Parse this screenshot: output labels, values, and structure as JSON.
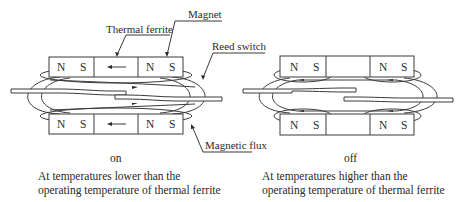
{
  "labels": {
    "magnet": "Magnet",
    "thermal_ferrite": "Thermal ferrite",
    "reed_switch": "Reed switch",
    "magnetic_flux": "Magnetic flux"
  },
  "poles": {
    "north": "N",
    "south": "S"
  },
  "ferrite_arrow": "←",
  "left_panel": {
    "state": "on",
    "caption_line1": "At temperatures lower than the",
    "caption_line2": "operating temperature of thermal ferrite"
  },
  "right_panel": {
    "state": "off",
    "caption_line1": "At temperatures higher than the",
    "caption_line2": "operating temperature of thermal ferrite"
  }
}
